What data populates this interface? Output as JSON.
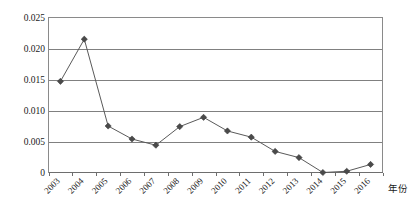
{
  "chart_data": {
    "type": "line",
    "title": "",
    "subtitle": "",
    "xlabel": "年份",
    "ylabel": "",
    "categories": [
      "2003",
      "2004",
      "2005",
      "2006",
      "2007",
      "2008",
      "2009",
      "2010",
      "2011",
      "2012",
      "2013",
      "2014",
      "2015",
      "2016"
    ],
    "values": [
      0.0147,
      0.0215,
      0.0075,
      0.0054,
      0.0044,
      0.0074,
      0.0089,
      0.0067,
      0.0057,
      0.0034,
      0.0024,
      0.0,
      0.0002,
      0.0013
    ],
    "series": [
      {
        "name": "",
        "values": [
          0.0147,
          0.0215,
          0.0075,
          0.0054,
          0.0044,
          0.0074,
          0.0089,
          0.0067,
          0.0057,
          0.0034,
          0.0024,
          0.0,
          0.0002,
          0.0013
        ]
      }
    ],
    "ylim": [
      0,
      0.025
    ],
    "ytick_values": [
      0,
      0.005,
      0.01,
      0.015,
      0.02,
      0.025
    ],
    "ytick_labels": [
      "0",
      "0.005",
      "0.010",
      "0.015",
      "0.020",
      "0.025"
    ],
    "grid": true,
    "grid_axis": "y",
    "legend": false,
    "legend_position": "none",
    "marker": "diamond",
    "colors": {
      "line": "#5a5a5a",
      "marker": "#4a4a4a",
      "gridline": "#808080",
      "frame": "#8a8a8a",
      "text": "#1a1a1a",
      "background": "#ffffff"
    },
    "annotations": []
  },
  "axis_title": {
    "x": "年份"
  }
}
